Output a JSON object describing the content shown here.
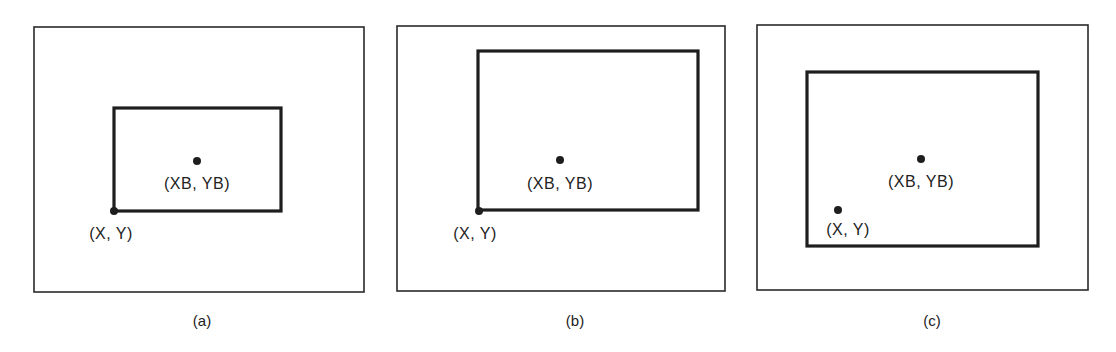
{
  "figure": {
    "panels": [
      {
        "caption": "(a)",
        "center_label": "(XB, YB)",
        "corner_label": "(X, Y)",
        "outer": {
          "x": 34,
          "y": 27,
          "w": 330,
          "h": 265
        },
        "inner": {
          "x": 114,
          "y": 108,
          "w": 167,
          "h": 103
        },
        "center_dot": {
          "cx": 197,
          "cy": 161
        },
        "corner_dot": {
          "cx": 114,
          "cy": 211
        }
      },
      {
        "caption": "(b)",
        "center_label": "(XB, YB)",
        "corner_label": "(X, Y)",
        "outer": {
          "x": 397,
          "y": 26,
          "w": 328,
          "h": 265
        },
        "inner": {
          "x": 478,
          "y": 51,
          "w": 220,
          "h": 159
        },
        "center_dot": {
          "cx": 560,
          "cy": 160
        },
        "corner_dot": {
          "cx": 479,
          "cy": 211
        }
      },
      {
        "caption": "(c)",
        "center_label": "(XB, YB)",
        "corner_label": "(X, Y)",
        "outer": {
          "x": 757,
          "y": 25,
          "w": 331,
          "h": 265
        },
        "inner": {
          "x": 807,
          "y": 72,
          "w": 231,
          "h": 174
        },
        "center_dot": {
          "cx": 921,
          "cy": 159
        },
        "corner_dot": {
          "cx": 838,
          "cy": 210
        }
      }
    ]
  }
}
